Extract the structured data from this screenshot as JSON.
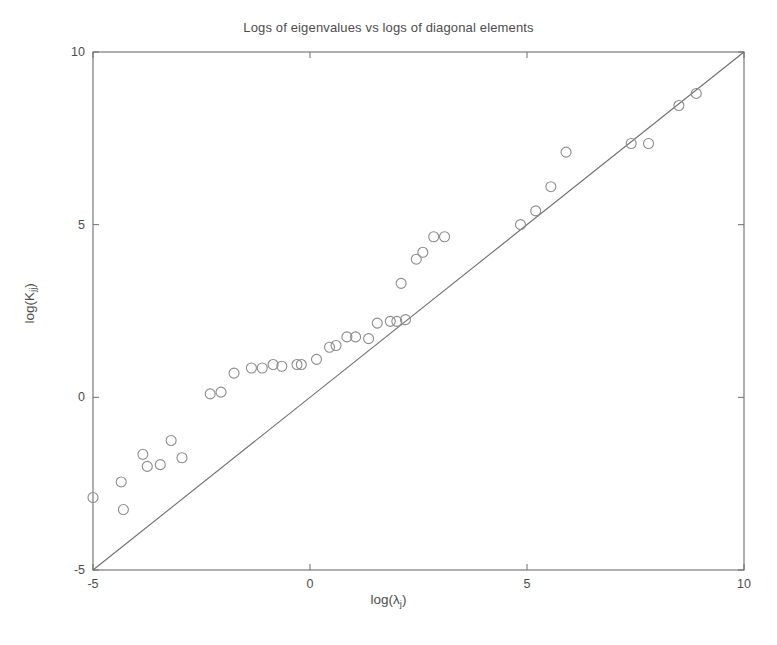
{
  "chart_data": {
    "type": "scatter",
    "title": "Logs of eigenvalues vs logs of diagonal elements",
    "xlabel": "log(λ",
    "xlabel_sub": "j",
    "xlabel_tail": ")",
    "ylabel": "log(K",
    "ylabel_sub": "jj",
    "ylabel_tail": ")",
    "xlim": [
      -5,
      10
    ],
    "ylim": [
      -5,
      10
    ],
    "xticks": [
      -5,
      0,
      5,
      10
    ],
    "yticks": [
      -5,
      0,
      5,
      10
    ],
    "xtick_labels": [
      "-5",
      "0",
      "5",
      "10"
    ],
    "ytick_labels": [
      "-5",
      "0",
      "5",
      "10"
    ],
    "grid": false,
    "legend": null,
    "marker": "open-circle",
    "marker_color": "#8c8c8c",
    "marker_size_px": 10,
    "reference_line": {
      "name": "identity-line",
      "equation": "y = x",
      "from": [
        -5,
        -5
      ],
      "to": [
        10,
        10
      ],
      "color": "#6e6e6e"
    },
    "axes_color": "#6e6e6e",
    "background": "#ffffff",
    "points": [
      [
        -5.0,
        -2.9
      ],
      [
        -4.35,
        -2.45
      ],
      [
        -4.3,
        -3.25
      ],
      [
        -3.85,
        -1.65
      ],
      [
        -3.75,
        -2.0
      ],
      [
        -3.45,
        -1.95
      ],
      [
        -3.2,
        -1.25
      ],
      [
        -2.95,
        -1.75
      ],
      [
        -2.3,
        0.1
      ],
      [
        -2.05,
        0.15
      ],
      [
        -1.75,
        0.7
      ],
      [
        -1.35,
        0.85
      ],
      [
        -1.1,
        0.85
      ],
      [
        -0.85,
        0.95
      ],
      [
        -0.65,
        0.9
      ],
      [
        -0.3,
        0.95
      ],
      [
        -0.2,
        0.95
      ],
      [
        0.15,
        1.1
      ],
      [
        0.45,
        1.45
      ],
      [
        0.6,
        1.5
      ],
      [
        0.85,
        1.75
      ],
      [
        1.05,
        1.75
      ],
      [
        1.35,
        1.7
      ],
      [
        1.55,
        2.15
      ],
      [
        1.85,
        2.2
      ],
      [
        2.0,
        2.2
      ],
      [
        2.2,
        2.25
      ],
      [
        2.1,
        3.3
      ],
      [
        2.45,
        4.0
      ],
      [
        2.6,
        4.2
      ],
      [
        2.85,
        4.65
      ],
      [
        3.1,
        4.65
      ],
      [
        4.85,
        5.0
      ],
      [
        5.2,
        5.4
      ],
      [
        5.55,
        6.1
      ],
      [
        5.9,
        7.1
      ],
      [
        7.4,
        7.35
      ],
      [
        7.8,
        7.35
      ],
      [
        8.5,
        8.45
      ],
      [
        8.9,
        8.8
      ]
    ]
  }
}
